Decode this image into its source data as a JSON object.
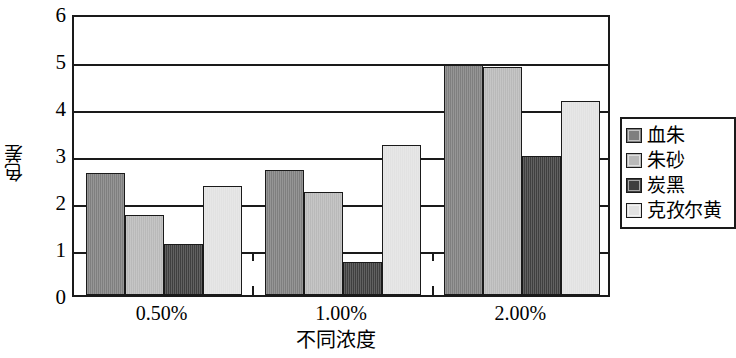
{
  "chart_data": {
    "type": "bar",
    "title": "",
    "xlabel": "不同浓度",
    "ylabel": "色差",
    "categories": [
      "0.50%",
      "1.00%",
      "2.00%"
    ],
    "series": [
      {
        "name": "血朱",
        "color": "#7f7f7f",
        "values": [
          2.6,
          2.65,
          4.9
        ]
      },
      {
        "name": "朱砂",
        "color": "#b9b9b9",
        "values": [
          1.7,
          2.2,
          4.85
        ]
      },
      {
        "name": "炭黑",
        "color": "#3f3f3f",
        "values": [
          1.08,
          0.7,
          2.95
        ]
      },
      {
        "name": "克孜尔黄",
        "color": "#e2e2e2",
        "values": [
          2.32,
          3.2,
          4.12
        ]
      }
    ],
    "ylim": [
      0,
      6
    ],
    "yticks": [
      "0",
      "1",
      "2",
      "3",
      "4",
      "5",
      "6"
    ],
    "ytick_values": [
      0,
      1,
      2,
      3,
      4,
      5,
      6
    ],
    "grid": true,
    "legend_position": "right"
  }
}
